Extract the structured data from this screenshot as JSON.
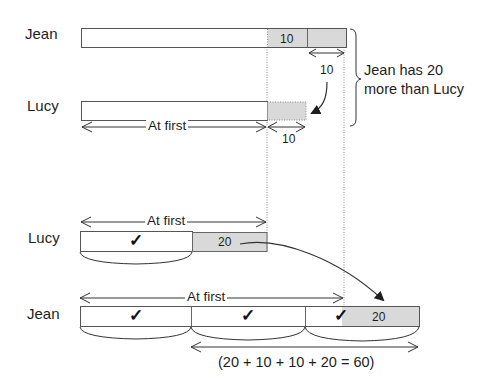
{
  "diagram": {
    "type": "bar-model",
    "colors": {
      "shade": "#d9d9d9",
      "line": "#555555",
      "dotted": "#8a8a8a",
      "text": "#1e1e1e"
    },
    "top_section": {
      "jean": {
        "label": "Jean",
        "segment_value": "10"
      },
      "lucy": {
        "label": "Lucy"
      },
      "transfer_label": "10",
      "lucy_gain_label": "10",
      "at_first_label": "At first",
      "brace_note_line1": "Jean has 20",
      "brace_note_line2": "more than Lucy"
    },
    "bottom_section": {
      "lucy": {
        "label": "Lucy",
        "unit_mark": "✓",
        "extra_value": "20",
        "at_first_label": "At first"
      },
      "jean": {
        "label": "Jean",
        "unit_marks": [
          "✓",
          "✓",
          "✓"
        ],
        "extra_value": "20",
        "at_first_label": "At first"
      },
      "equation": "(20 + 10 + 10 + 20 = 60)"
    }
  }
}
